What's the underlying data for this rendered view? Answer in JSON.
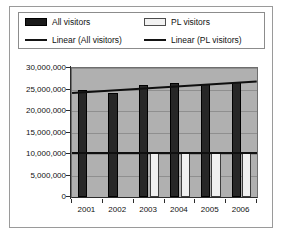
{
  "chart_data": {
    "type": "bar",
    "title": "",
    "xlabel": "",
    "ylabel": "",
    "categories": [
      "2001",
      "2002",
      "2003",
      "2004",
      "2005",
      "2006"
    ],
    "ylim": [
      0,
      30000000
    ],
    "ytick_values": [
      0,
      5000000,
      10000000,
      15000000,
      20000000,
      25000000,
      30000000
    ],
    "ytick_labels": [
      "0",
      "5,000,000",
      "10,000,000",
      "15,000,000",
      "20,000,000",
      "25,000,000",
      "30,000,000"
    ],
    "grid": true,
    "legend_position": "top",
    "series": [
      {
        "name": "All visitors",
        "kind": "bar",
        "color": "#272727",
        "values": [
          24900000,
          24200000,
          26100000,
          26500000,
          26300000,
          26800000
        ]
      },
      {
        "name": "PL visitors",
        "kind": "bar",
        "color": "#f0f0f0",
        "values": [
          null,
          null,
          10400000,
          10400000,
          10400000,
          10400000
        ]
      },
      {
        "name": "Linear (All visitors)",
        "kind": "trendline",
        "color": "#0f0f0f",
        "endpoints": [
          24500000,
          27200000
        ]
      },
      {
        "name": "Linear (PL visitors)",
        "kind": "trendline",
        "color": "#0f0f0f",
        "endpoints": [
          10500000,
          10500000
        ]
      }
    ]
  },
  "legend": {
    "items": [
      {
        "label": "All visitors",
        "swatch": "dark-bar-swatch"
      },
      {
        "label": "PL visitors",
        "swatch": "light-bar-swatch"
      },
      {
        "label": "Linear (All visitors)",
        "swatch": "dark-line-swatch"
      },
      {
        "label": "Linear (PL visitors)",
        "swatch": "dark-line-swatch"
      }
    ]
  },
  "colors": {
    "plot_background": "#b0b0b0",
    "panel_background": "#ffffff",
    "gridline": "#8f8f8f",
    "axis": "#2b2b2b",
    "all_visitors": "#272727",
    "pl_visitors": "#f0f0f0",
    "trendline": "#0f0f0f"
  }
}
